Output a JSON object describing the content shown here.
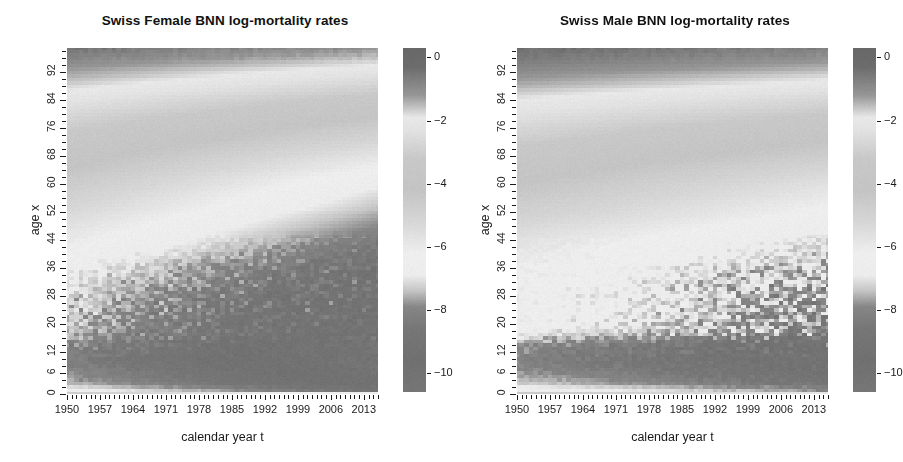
{
  "figure": {
    "background": "#ffffff",
    "ink": "#1a1a1a",
    "width": 900,
    "height": 462
  },
  "panels": [
    {
      "id": "female",
      "title": "Swiss Female BNN log-mortality rates",
      "xlabel": "calendar year t",
      "ylabel": "age x"
    },
    {
      "id": "male",
      "title": "Swiss Male BNN log-mortality rates",
      "xlabel": "calendar year t",
      "ylabel": "age x"
    }
  ],
  "chart_data": [
    {
      "type": "heatmap",
      "panel": "female",
      "title": "Swiss Female BNN log-mortality rates",
      "xlabel": "calendar year t",
      "ylabel": "age x",
      "x": "calendar year t",
      "y": "age x",
      "z": "log-mortality rate log(m)",
      "xlim": [
        1950,
        2016
      ],
      "ylim": [
        0,
        99
      ],
      "xticks_major": [
        1950,
        1957,
        1964,
        1971,
        1978,
        1985,
        1992,
        1999,
        2006,
        2013
      ],
      "xticks_minor_step": 1,
      "yticks_major": [
        0,
        6,
        12,
        20,
        28,
        36,
        44,
        52,
        60,
        68,
        76,
        84,
        92
      ],
      "yticks_minor_step": 2,
      "grid": false,
      "colorbar": {
        "position": "right",
        "ticks": [
          0,
          -2,
          -4,
          -6,
          -8,
          -10
        ],
        "range": [
          0.3,
          -10.6
        ],
        "scale": "terrain-grayscale",
        "stops": [
          {
            "value": 0.3,
            "gray": 104
          },
          {
            "value": -0.3,
            "gray": 108
          },
          {
            "value": -1.2,
            "gray": 150
          },
          {
            "value": -1.9,
            "gray": 232
          },
          {
            "value": -2.3,
            "gray": 226
          },
          {
            "value": -3.2,
            "gray": 200
          },
          {
            "value": -4.2,
            "gray": 196
          },
          {
            "value": -5.2,
            "gray": 214
          },
          {
            "value": -6.2,
            "gray": 238
          },
          {
            "value": -6.9,
            "gray": 236
          },
          {
            "value": -7.4,
            "gray": 196
          },
          {
            "value": -7.9,
            "gray": 134
          },
          {
            "value": -8.6,
            "gray": 118
          },
          {
            "value": -9.6,
            "gray": 112
          },
          {
            "value": -10.6,
            "gray": 118
          }
        ]
      },
      "surface_model": {
        "description": "log-mortality surface: high (dark) at age 0 infancy and very old age, light mid-ages, deepening minimum for teens/young adults improving over calendar time",
        "age_profile": [
          {
            "age": 0,
            "log_m": -4.6
          },
          {
            "age": 1,
            "log_m": -6.6
          },
          {
            "age": 3,
            "log_m": -7.5
          },
          {
            "age": 6,
            "log_m": -7.9
          },
          {
            "age": 10,
            "log_m": -8.2
          },
          {
            "age": 14,
            "log_m": -7.9
          },
          {
            "age": 18,
            "log_m": -7.5
          },
          {
            "age": 22,
            "log_m": -7.4
          },
          {
            "age": 28,
            "log_m": -7.2
          },
          {
            "age": 36,
            "log_m": -6.7
          },
          {
            "age": 44,
            "log_m": -6.0
          },
          {
            "age": 52,
            "log_m": -5.3
          },
          {
            "age": 60,
            "log_m": -4.6
          },
          {
            "age": 68,
            "log_m": -3.9
          },
          {
            "age": 76,
            "log_m": -3.1
          },
          {
            "age": 84,
            "log_m": -2.2
          },
          {
            "age": 92,
            "log_m": -1.3
          },
          {
            "age": 99,
            "log_m": -0.5
          }
        ],
        "year_drift_per_decade": -0.34,
        "young_age_noise": 0.55,
        "noise_growth_with_year": 1.9
      }
    },
    {
      "type": "heatmap",
      "panel": "male",
      "title": "Swiss Male BNN log-mortality rates",
      "xlabel": "calendar year t",
      "ylabel": "age x",
      "x": "calendar year t",
      "y": "age x",
      "z": "log-mortality rate log(m)",
      "xlim": [
        1950,
        2016
      ],
      "ylim": [
        0,
        99
      ],
      "xticks_major": [
        1950,
        1957,
        1964,
        1971,
        1978,
        1985,
        1992,
        1999,
        2006,
        2013
      ],
      "xticks_minor_step": 1,
      "yticks_major": [
        0,
        6,
        12,
        20,
        28,
        36,
        44,
        52,
        60,
        68,
        76,
        84,
        92
      ],
      "yticks_minor_step": 2,
      "grid": false,
      "colorbar": {
        "position": "right",
        "ticks": [
          0,
          -2,
          -4,
          -6,
          -8,
          -10
        ],
        "range": [
          0.3,
          -10.6
        ],
        "scale": "terrain-grayscale",
        "stops": [
          {
            "value": 0.3,
            "gray": 104
          },
          {
            "value": -0.3,
            "gray": 108
          },
          {
            "value": -1.2,
            "gray": 150
          },
          {
            "value": -1.9,
            "gray": 232
          },
          {
            "value": -2.3,
            "gray": 226
          },
          {
            "value": -3.2,
            "gray": 200
          },
          {
            "value": -4.2,
            "gray": 196
          },
          {
            "value": -5.2,
            "gray": 214
          },
          {
            "value": -6.2,
            "gray": 238
          },
          {
            "value": -6.9,
            "gray": 236
          },
          {
            "value": -7.4,
            "gray": 196
          },
          {
            "value": -7.9,
            "gray": 134
          },
          {
            "value": -8.6,
            "gray": 118
          },
          {
            "value": -9.6,
            "gray": 112
          },
          {
            "value": -10.6,
            "gray": 118
          }
        ]
      },
      "surface_model": {
        "description": "male surface: flatter light plateau across ages 16-50, sharp dark band below age 16, noise concentrated after 1999",
        "age_profile": [
          {
            "age": 0,
            "log_m": -4.4
          },
          {
            "age": 1,
            "log_m": -6.4
          },
          {
            "age": 3,
            "log_m": -7.3
          },
          {
            "age": 6,
            "log_m": -7.8
          },
          {
            "age": 10,
            "log_m": -8.1
          },
          {
            "age": 14,
            "log_m": -7.8
          },
          {
            "age": 18,
            "log_m": -6.6
          },
          {
            "age": 22,
            "log_m": -6.4
          },
          {
            "age": 28,
            "log_m": -6.3
          },
          {
            "age": 36,
            "log_m": -6.1
          },
          {
            "age": 44,
            "log_m": -5.6
          },
          {
            "age": 52,
            "log_m": -4.9
          },
          {
            "age": 60,
            "log_m": -4.2
          },
          {
            "age": 68,
            "log_m": -3.5
          },
          {
            "age": 76,
            "log_m": -2.7
          },
          {
            "age": 84,
            "log_m": -1.9
          },
          {
            "age": 92,
            "log_m": -1.0
          },
          {
            "age": 99,
            "log_m": -0.3
          }
        ],
        "year_drift_per_decade": -0.22,
        "young_age_noise": 0.5,
        "noise_growth_with_year": 2.6
      }
    }
  ],
  "geometry": {
    "plot": {
      "left": 67,
      "top": 48,
      "right": 378,
      "bottom": 394
    },
    "colorbar": {
      "left": 403,
      "top": 48,
      "right": 426,
      "bottom": 392
    },
    "panel_offset_right": 423
  }
}
